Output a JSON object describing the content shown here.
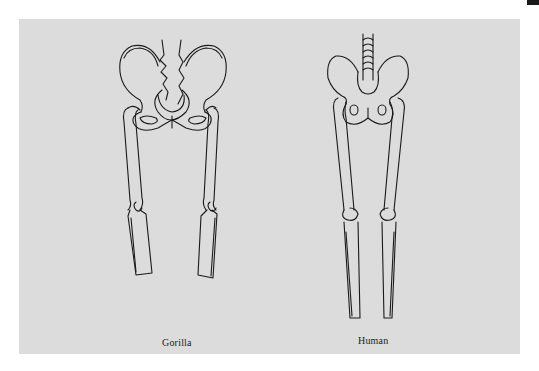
{
  "figure": {
    "panels": [
      {
        "id": "gorilla",
        "label": "Gorilla"
      },
      {
        "id": "human",
        "label": "Human"
      }
    ],
    "colors": {
      "background": "#ffffff",
      "panel": "#dcdcdc",
      "line": "#1a1a1a"
    }
  }
}
